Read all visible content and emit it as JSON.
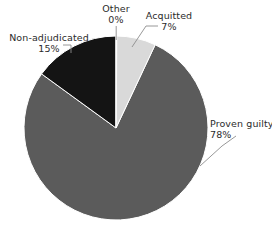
{
  "chart_data": {
    "type": "pie",
    "title": "",
    "subtitle": "",
    "xlabel": "",
    "ylabel": "",
    "legend_position": "none",
    "grid": false,
    "labels_on_slices": false,
    "start_angle_deg": 0,
    "direction": "clockwise",
    "categories": [
      "Other",
      "Acquitted",
      "Proven guilty",
      "Non-adjudicated"
    ],
    "values": [
      0,
      7,
      78,
      15
    ],
    "units": "percent",
    "slices": [
      {
        "name": "Other",
        "value": 0,
        "percent_label": "0%",
        "color": "#ffffff",
        "start_deg": 0,
        "end_deg": 0.5
      },
      {
        "name": "Acquitted",
        "value": 7,
        "percent_label": "7%",
        "color": "#d9d9d9",
        "start_deg": 0.5,
        "end_deg": 25.7
      },
      {
        "name": "Proven guilty",
        "value": 78,
        "percent_label": "78%",
        "color": "#5b5b5b",
        "start_deg": 25.7,
        "end_deg": 306.5
      },
      {
        "name": "Non-adjudicated",
        "value": 15,
        "percent_label": "15%",
        "color": "#141414",
        "start_deg": 306.5,
        "end_deg": 360
      }
    ]
  },
  "labels": {
    "other": {
      "name": "Other",
      "percent": "0%"
    },
    "acquitted": {
      "name": "Acquitted",
      "percent": "7%"
    },
    "non_adjudicated": {
      "name": "Non-adjudicated",
      "percent": "15%"
    },
    "proven_guilty": {
      "name": "Proven guilty",
      "percent": "78%"
    }
  },
  "style": {
    "background": "#ffffff",
    "text_color": "#2b2b2b",
    "leader_line_color": "#8c8c8c",
    "slice_edge_color": "#ffffff"
  },
  "geometry": {
    "center_x": 116,
    "center_y": 128,
    "radius": 92
  }
}
